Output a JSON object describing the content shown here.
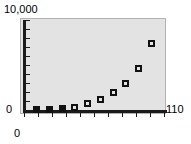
{
  "chart_data": {
    "type": "scatter",
    "title": "",
    "xlabel": "",
    "ylabel": "",
    "xlim": [
      0,
      110
    ],
    "ylim": [
      0,
      10000
    ],
    "grid": false,
    "legend": null,
    "x_tick_labels": [
      "0",
      "110"
    ],
    "y_tick_labels": [
      "0",
      "10,000"
    ],
    "x_tick_count": 11,
    "y_tick_count": 11,
    "marker_style": "open-square",
    "x": [
      10,
      20,
      30,
      40,
      50,
      60,
      70,
      80,
      90,
      100
    ],
    "y": [
      40,
      70,
      180,
      320,
      700,
      1150,
      1900,
      3000,
      4600,
      7400
    ],
    "series": [
      {
        "name": "",
        "x": [
          10,
          20,
          30,
          40,
          50,
          60,
          70,
          80,
          90,
          100
        ],
        "values": [
          40,
          70,
          180,
          320,
          700,
          1150,
          1900,
          3000,
          4600,
          7400
        ]
      }
    ]
  },
  "axes": {
    "y_max_label": "10,000",
    "y_min_label": "0",
    "x_max_label": "110",
    "x_min_label": "0"
  },
  "colors": {
    "plot_background": "#e3e3e3",
    "plot_border": "#b2b2b2",
    "axis": "#1a1a1a",
    "marker_edge": "#111111",
    "page_background": "#ffffff",
    "text": "#000000"
  }
}
